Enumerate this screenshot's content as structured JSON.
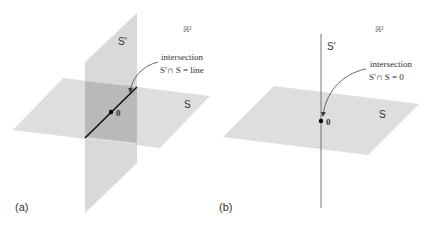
{
  "colors": {
    "plane_fill": "#dedede",
    "vertical_plane_fill": "#d9d9d9",
    "overlap_fill": "#b9b9b9",
    "line_color": "#111111",
    "thin_line_color": "#555555",
    "text_color": "#333333"
  },
  "panel_a": {
    "label": "(a)",
    "space_label": "ℝ³",
    "plane_s_label": "S",
    "plane_s_prime_label": "S′",
    "origin_label": "0",
    "annotation_line1": "intersection",
    "annotation_line2": "S′∩ S = line"
  },
  "panel_b": {
    "label": "(b)",
    "space_label": "ℝ³",
    "plane_s_label": "S",
    "line_s_prime_label": "S′",
    "origin_label": "0",
    "annotation_line1": "intersection",
    "annotation_line2": "S′∩ S = 0"
  }
}
